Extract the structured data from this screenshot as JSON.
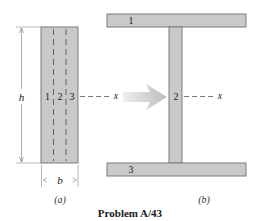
{
  "figure": {
    "caption": "Problem A/43",
    "colors": {
      "fill": "#c9c9c9",
      "stroke": "#7a7a7a",
      "line": "#555555",
      "arrow": "#c4c4c4",
      "text": "#1a1a1a"
    },
    "part_a": {
      "label": "(a)",
      "strip_labels": [
        "1",
        "2",
        "3"
      ],
      "height_label": "h",
      "width_label": "b",
      "axis_label": "x"
    },
    "part_b": {
      "label": "(b)",
      "top_flange_label": "1",
      "web_label": "2",
      "bottom_flange_label": "3",
      "axis_label": "x"
    }
  }
}
